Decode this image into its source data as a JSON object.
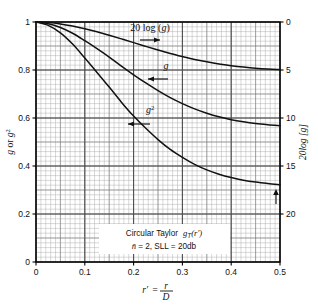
{
  "chart_data": {
    "type": "line",
    "title": "",
    "xlabel": "r' = r/D",
    "ylabel_left": "g or g²",
    "ylabel_right": "20log [g]",
    "xlim": [
      0,
      0.5
    ],
    "ylim_left": [
      0,
      1
    ],
    "ylim_right": [
      -25,
      0
    ],
    "grid": true,
    "grid_minor": true,
    "legend_position": "inline-annotations",
    "xticks": [
      0,
      0.1,
      0.2,
      0.3,
      0.4,
      0.5
    ],
    "xticklabels": [
      "0",
      "0.1",
      "0.2",
      "0.3",
      "0.4",
      "0.5"
    ],
    "yticks_left": [
      0,
      0.2,
      0.4,
      0.6,
      0.8,
      1
    ],
    "yticklabels_left": [
      "0",
      "0.2",
      "0.4",
      "0.6",
      "0.8",
      "1"
    ],
    "yticks_right": [
      0,
      -5,
      -10,
      -15,
      -20
    ],
    "yticklabels_right": [
      "0",
      "5",
      "10",
      "15",
      "20"
    ],
    "annotation_box": {
      "line1": "Circular Taylor  g_T(r')",
      "line1_a": "Circular Taylor",
      "line1_b": "g",
      "line1_sub": "T",
      "line1_c": "(r′)",
      "line2": "n̄ = 2, SLL = 20db"
    },
    "series": [
      {
        "name": "20 log (g)",
        "label": "20 log (g)",
        "axis": "right",
        "arrow": "right",
        "x": [
          0,
          0.025,
          0.05,
          0.075,
          0.1,
          0.125,
          0.15,
          0.175,
          0.2,
          0.225,
          0.25,
          0.275,
          0.3,
          0.325,
          0.35,
          0.375,
          0.4,
          0.425,
          0.45,
          0.475,
          0.5
        ],
        "values": [
          0,
          -0.06,
          -0.2,
          -0.42,
          -0.7,
          -1.02,
          -1.38,
          -1.76,
          -2.15,
          -2.54,
          -2.92,
          -3.28,
          -3.6,
          -3.9,
          -4.15,
          -4.37,
          -4.55,
          -4.7,
          -4.82,
          -4.9,
          -4.95
        ]
      },
      {
        "name": "g",
        "label": "g",
        "axis": "left",
        "arrow": "left",
        "x": [
          0,
          0.025,
          0.05,
          0.075,
          0.1,
          0.125,
          0.15,
          0.175,
          0.2,
          0.225,
          0.25,
          0.275,
          0.3,
          0.325,
          0.35,
          0.375,
          0.4,
          0.425,
          0.45,
          0.475,
          0.5
        ],
        "values": [
          1.0,
          0.993,
          0.977,
          0.953,
          0.922,
          0.889,
          0.854,
          0.816,
          0.78,
          0.746,
          0.714,
          0.685,
          0.66,
          0.638,
          0.62,
          0.605,
          0.593,
          0.584,
          0.577,
          0.572,
          0.568
        ]
      },
      {
        "name": "g²",
        "label": "g²",
        "axis": "left",
        "arrow": "left",
        "x": [
          0,
          0.025,
          0.05,
          0.075,
          0.1,
          0.125,
          0.15,
          0.175,
          0.2,
          0.225,
          0.25,
          0.275,
          0.3,
          0.325,
          0.35,
          0.375,
          0.4,
          0.425,
          0.45,
          0.475,
          0.5
        ],
        "values": [
          1.0,
          0.986,
          0.955,
          0.908,
          0.85,
          0.79,
          0.729,
          0.666,
          0.608,
          0.557,
          0.51,
          0.469,
          0.436,
          0.407,
          0.384,
          0.366,
          0.352,
          0.341,
          0.333,
          0.327,
          0.322
        ]
      }
    ]
  },
  "labels": {
    "curve_20log": "20 log (",
    "curve_20log_g": "g",
    "curve_20log_end": ")",
    "curve_g": "g",
    "curve_g2": "g",
    "curve_g2_sup": "2",
    "yleft_g": "g",
    "yleft_or": " or ",
    "yleft_g2": "g",
    "yleft_g2_sup": "2",
    "yright": "20log [",
    "yright_g": "g",
    "yright_end": "]",
    "xlabel_rp": "r′",
    "xlabel_eq": "=",
    "xlabel_num": "r",
    "xlabel_den": "D",
    "box_circular": "Circular Taylor",
    "box_g": "g",
    "box_T": "T",
    "box_rp": "(r′)",
    "box_nbar": "n̄",
    "box_line2_rest": "= 2, SLL = 20db"
  },
  "colors": {
    "curve": "#111111",
    "grid_minor": "#a9a9a9",
    "grid_major": "#4a4a4a",
    "frame": "#000000",
    "background": "#ffffff",
    "text": "#111111"
  }
}
